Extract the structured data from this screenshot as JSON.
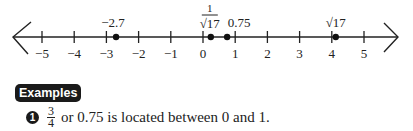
{
  "chart_data": {
    "type": "scatter",
    "title": "",
    "xlabel": "",
    "ylabel": "",
    "xlim": [
      -5.5,
      5.5
    ],
    "ticks": [
      -5,
      -4,
      -3,
      -2,
      -1,
      0,
      1,
      2,
      3,
      4,
      5
    ],
    "tick_labels": [
      "−5",
      "−4",
      "−3",
      "−2",
      "−1",
      "0",
      "1",
      "2",
      "3",
      "4",
      "5"
    ],
    "points": [
      {
        "label": "−2.7",
        "value": -2.7
      },
      {
        "label": "1/√17",
        "value": 0.2425
      },
      {
        "label": "0.75",
        "value": 0.75
      },
      {
        "label": "√17",
        "value": 4.1231
      }
    ],
    "arrows": [
      "left",
      "right"
    ],
    "grid": false
  },
  "section": {
    "badge": "Examples"
  },
  "examples": [
    {
      "number": "1",
      "fraction": {
        "numerator": "3",
        "denominator": "4"
      },
      "text": "or 0.75 is located between 0 and 1."
    }
  ]
}
